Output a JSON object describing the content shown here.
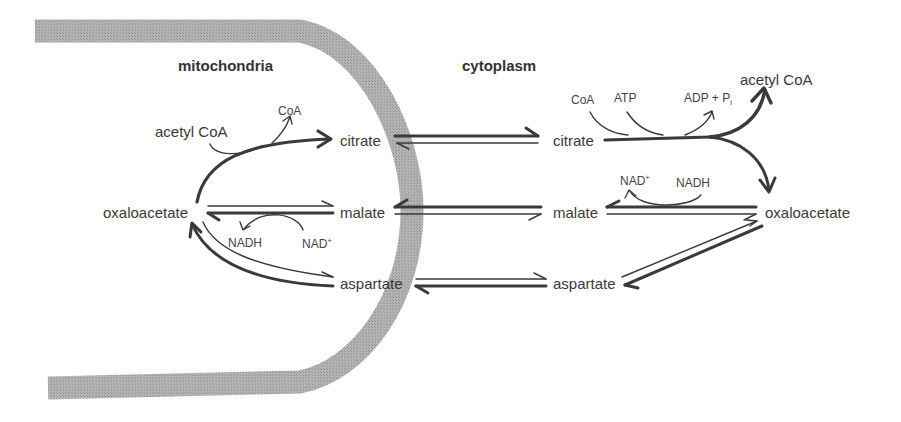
{
  "figure": {
    "type": "metabolic-pathway-diagram"
  },
  "compartments": {
    "left": "mitochondria",
    "right": "cytoplasm"
  },
  "colors": {
    "membrane": "#a8a8a8",
    "arrow": "#3a3a3a",
    "text": "#3a3a3a",
    "background": "#ffffff"
  },
  "mitochondria": {
    "acetyl_coa": "acetyl CoA",
    "coa": "CoA",
    "citrate": "citrate",
    "oxaloacetate": "oxaloacetate",
    "malate": "malate",
    "nadh": "NADH",
    "nad": "NAD",
    "nad_sup": "+",
    "aspartate": "aspartate"
  },
  "cytoplasm": {
    "citrate": "citrate",
    "coa": "CoA",
    "atp": "ATP",
    "adp": "ADP + P",
    "adp_sub": "i",
    "acetyl_coa": "acetyl CoA",
    "nad": "NAD",
    "nad_sup": "+",
    "nadh": "NADH",
    "malate": "malate",
    "oxaloacetate": "oxaloacetate",
    "aspartate": "aspartate"
  },
  "reactions": [
    {
      "from": "acetyl CoA + oxaloacetate (mito)",
      "to": "citrate (mito)",
      "releases": "CoA"
    },
    {
      "from": "citrate (mito)",
      "to": "citrate (cyto)",
      "direction": "reversible, net outward"
    },
    {
      "from": "citrate (cyto) + CoA + ATP",
      "to": "acetyl CoA + oxaloacetate (cyto)",
      "releases": "ADP + Pi"
    },
    {
      "from": "oxaloacetate (cyto) + NADH",
      "to": "malate (cyto)",
      "releases": "NAD+"
    },
    {
      "from": "malate (cyto)",
      "to": "malate (mito)",
      "direction": "reversible, net inward"
    },
    {
      "from": "malate (mito) + NAD+",
      "to": "oxaloacetate (mito)",
      "releases": "NADH"
    },
    {
      "from": "oxaloacetate (cyto)",
      "to": "aspartate (cyto)",
      "direction": "reversible"
    },
    {
      "from": "aspartate (cyto)",
      "to": "aspartate (mito)",
      "direction": "reversible, net inward"
    },
    {
      "from": "aspartate (mito)",
      "to": "oxaloacetate (mito)",
      "direction": "reversible"
    }
  ]
}
